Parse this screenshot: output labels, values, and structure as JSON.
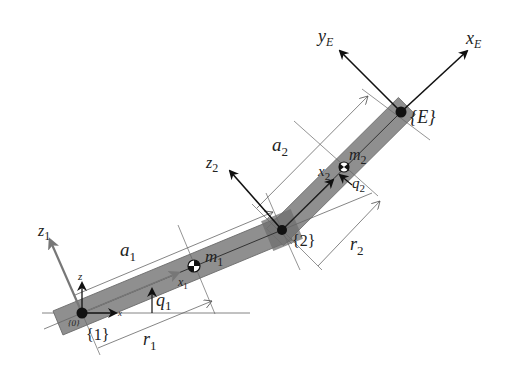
{
  "diagram": {
    "colors": {
      "link": "#8f8f8f",
      "link_edge": "#6a6a6a",
      "axis": "#111111",
      "thin_line": "#555555",
      "frame0_axis": "#777777"
    },
    "frames": {
      "base_small_z": "z",
      "base_small_x": "x",
      "frame0_label": "{0}",
      "frame1_label": "{1}",
      "frame2_label": "{2}",
      "frameE_label": "{E}"
    },
    "axes": {
      "z1": {
        "main": "z",
        "sub": "1"
      },
      "x1": {
        "main": "x",
        "sub": "1"
      },
      "z2": {
        "main": "z",
        "sub": "2"
      },
      "x2": {
        "main": "x",
        "sub": "2"
      },
      "yE": {
        "main": "y",
        "sub": "E"
      },
      "xE": {
        "main": "x",
        "sub": "E"
      }
    },
    "dimensions": {
      "a1": {
        "main": "a",
        "sub": "1"
      },
      "a2": {
        "main": "a",
        "sub": "2"
      },
      "r1": {
        "main": "r",
        "sub": "1"
      },
      "r2": {
        "main": "r",
        "sub": "2"
      }
    },
    "masses": {
      "m1": {
        "main": "m",
        "sub": "1"
      },
      "m2": {
        "main": "m",
        "sub": "2"
      }
    },
    "joint_angles": {
      "q1": {
        "main": "q",
        "sub": "1"
      },
      "q2": {
        "main": "q",
        "sub": "2"
      }
    }
  }
}
